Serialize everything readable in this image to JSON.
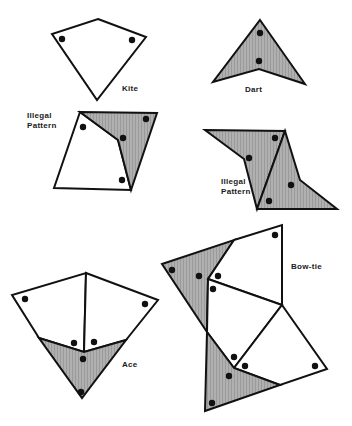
{
  "figure": {
    "labels": {
      "kite": "Kite",
      "dart": "Dart",
      "illegal_1_line1": "Illegal",
      "illegal_1_line2": "Pattern",
      "illegal_2_line1": "Illegal",
      "illegal_2_line2": "Pattern",
      "ace": "Ace",
      "bow_tie": "Bow-tie"
    },
    "colors": {
      "outline": "#111111",
      "shaded": "#a8a8a8",
      "white": "#ffffff",
      "dot": "#111111"
    }
  }
}
